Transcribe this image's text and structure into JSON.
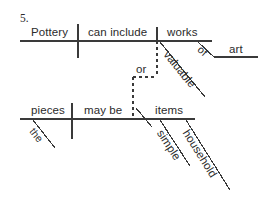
{
  "page": {
    "exercise_number": "5.",
    "background_color": "#ffffff",
    "ink_color": "#3a3a3a",
    "text_color": "#2b2b2b",
    "width": 267,
    "height": 205
  },
  "diagram": {
    "type": "reed-kellogg-sentence-diagram",
    "sentence": "Pottery can include valuable works of art or the pieces may be simple household items",
    "clauses": [
      {
        "id": "clause-top",
        "subject": "Pottery",
        "verb": "can include",
        "object": "works",
        "modifiers": [
          {
            "word": "valuable",
            "modifies": "works",
            "kind": "adjective"
          }
        ],
        "phrases": [
          {
            "preposition": "of",
            "object": "art",
            "modifies": "works"
          }
        ]
      },
      {
        "id": "clause-bottom",
        "subject": "pieces",
        "verb": "may be",
        "complement": "items",
        "modifiers": [
          {
            "word": "the",
            "modifies": "pieces",
            "kind": "article"
          },
          {
            "word": "simple",
            "modifies": "items",
            "kind": "adjective"
          },
          {
            "word": "household",
            "modifies": "items",
            "kind": "adjective"
          }
        ]
      }
    ],
    "conjunction": {
      "word": "or",
      "style": "dashed",
      "joins": [
        "clause-top",
        "clause-bottom"
      ]
    }
  },
  "labels": {
    "pottery": "Pottery",
    "can_include": "can include",
    "works": "works",
    "valuable": "valuable",
    "of": "of",
    "art": "art",
    "or": "or",
    "pieces": "pieces",
    "the": "the",
    "may_be": "may be",
    "items": "items",
    "simple": "simple",
    "household": "household"
  }
}
